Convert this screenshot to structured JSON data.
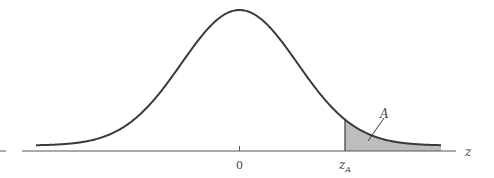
{
  "chart_data": {
    "type": "area",
    "title": "",
    "xlabel": "z",
    "ylabel": "",
    "tick_labels": [
      "0",
      "z_A"
    ],
    "annotations": [
      "A"
    ],
    "distribution": {
      "mean": 0,
      "sd": 1
    },
    "shaded_region": {
      "from": "z_A",
      "to": "+inf",
      "label": "A",
      "color": "#bdbdbd"
    },
    "curve_color": "#3a3a3a",
    "grid": false,
    "legend": null
  },
  "labels": {
    "axis_z": "z",
    "tick_zero": "0",
    "tick_zA_main": "z",
    "tick_zA_sub": "A",
    "area": "A"
  }
}
